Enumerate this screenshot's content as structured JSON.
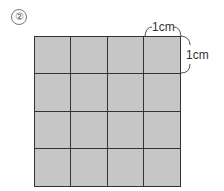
{
  "problem_number": "②",
  "diagram": {
    "rows": 4,
    "cols": 4,
    "cell_color": "#c6c6c6",
    "line_color": "#333333"
  },
  "dimensions": {
    "top_label": "1cm",
    "right_label": "1cm"
  }
}
